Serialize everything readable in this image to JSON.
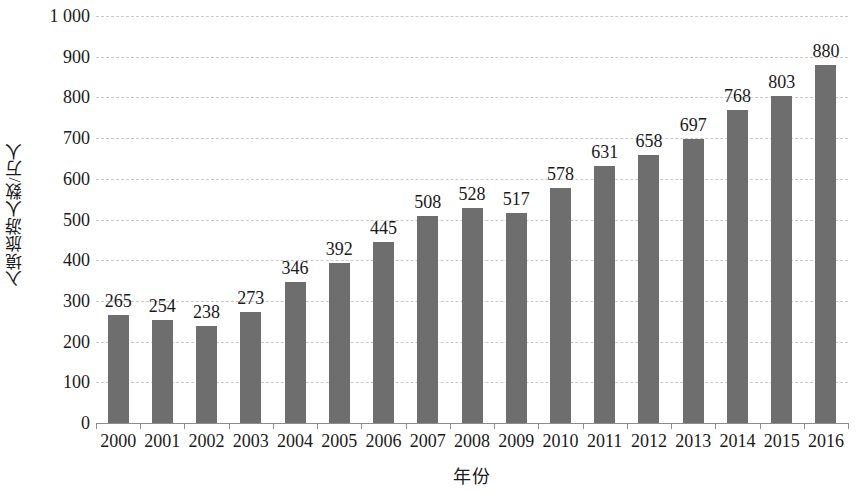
{
  "chart_data": {
    "type": "bar",
    "title": "",
    "subtitle": "",
    "xlabel": "年份",
    "ylabel": "入境旅游人数/万人",
    "categories": [
      "2000",
      "2001",
      "2002",
      "2003",
      "2004",
      "2005",
      "2006",
      "2007",
      "2008",
      "2009",
      "2010",
      "2011",
      "2012",
      "2013",
      "2014",
      "2015",
      "2016"
    ],
    "values": [
      265,
      254,
      238,
      273,
      346,
      392,
      445,
      508,
      528,
      517,
      578,
      631,
      658,
      697,
      768,
      803,
      880
    ],
    "value_labels": [
      "265",
      "254",
      "238",
      "273",
      "346",
      "392",
      "445",
      "508",
      "528",
      "517",
      "578",
      "631",
      "658",
      "697",
      "768",
      "803",
      "880"
    ],
    "ylim": [
      0,
      1000
    ],
    "ytick_values": [
      0,
      100,
      200,
      300,
      400,
      500,
      600,
      700,
      800,
      900,
      1000
    ],
    "ytick_labels": [
      "0",
      "100",
      "200",
      "300",
      "400",
      "500",
      "600",
      "700",
      "800",
      "900",
      "1 000"
    ],
    "grid": true,
    "grid_axis": "y",
    "legend": false,
    "legend_position": "none",
    "bar_color": "#6e6e6e",
    "gridline_color": "#c9c9c9",
    "axis_color": "#8d8d8d",
    "text_color": "#1a1a1a",
    "background_color": "#ffffff",
    "show_value_labels": true
  }
}
